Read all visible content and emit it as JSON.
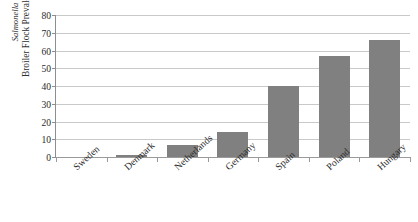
{
  "figure": {
    "caption_remnant": ". . . . . . . .",
    "axis_title_species": "Salmonella",
    "axis_title_measure": "Broiler Flock Prevalence (%)"
  },
  "chart_data": {
    "type": "bar",
    "title": "",
    "xlabel": "",
    "ylabel": "Salmonella Broiler Flock Prevalence (%)",
    "ylim": [
      0,
      80
    ],
    "ytick_step": 10,
    "yticks": [
      0,
      10,
      20,
      30,
      40,
      50,
      60,
      70,
      80
    ],
    "ytick_labels": [
      "0",
      "10",
      "20",
      "30",
      "40",
      "50",
      "60",
      "70",
      "80"
    ],
    "grid": true,
    "grid_axis": "y",
    "legend": false,
    "bar_color": "#808080",
    "categories": [
      "Sweden",
      "Denmark",
      "Netherlands",
      "Germany",
      "Spain",
      "Poland",
      "Hungary"
    ],
    "values": [
      0,
      1,
      7,
      14,
      40,
      57,
      66
    ]
  }
}
